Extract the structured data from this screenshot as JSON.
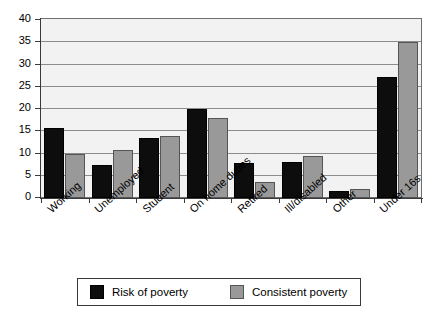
{
  "chart_data": {
    "type": "bar",
    "title": "",
    "subtitle": "",
    "xlabel": "",
    "ylabel": "",
    "ylim": [
      0,
      40
    ],
    "ytick_step": 5,
    "yticks": [
      40,
      35,
      30,
      25,
      20,
      15,
      10,
      5,
      0
    ],
    "grid": true,
    "grid_axis": "y",
    "legend_position": "bottom",
    "categories": [
      "Working",
      "Unemployed",
      "Student",
      "On home duties",
      "Retired",
      "Ill/disabled",
      "Other",
      "Under 16s"
    ],
    "series": [
      {
        "name": "Risk of poverty",
        "color": "#0d0d0d",
        "values": [
          15.8,
          7.5,
          13.4,
          20.0,
          7.8,
          8.0,
          1.5,
          27.2
        ]
      },
      {
        "name": "Consistent poverty",
        "color": "#999999",
        "values": [
          10.0,
          10.8,
          13.9,
          18.0,
          3.5,
          9.4,
          2.0,
          35.0
        ]
      }
    ]
  },
  "legend": {
    "entries": [
      {
        "label": "Risk of poverty"
      },
      {
        "label": "Consistent poverty"
      }
    ]
  }
}
